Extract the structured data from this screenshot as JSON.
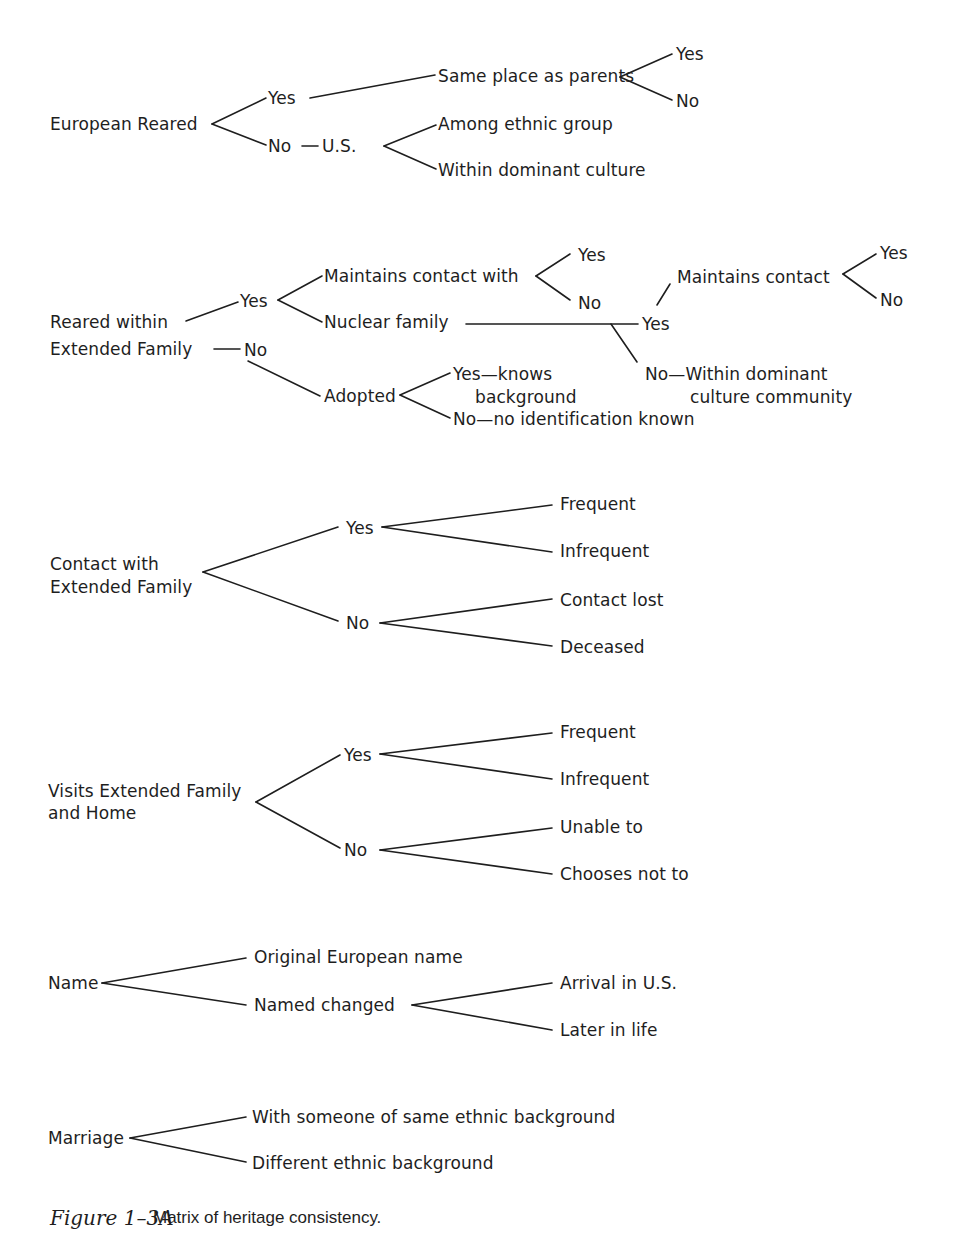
{
  "diagram": {
    "title": "Matrix of heritage consistency",
    "sections": [
      {
        "root": "European Reared",
        "nodes": {
          "yes": "Yes",
          "same_place": "Same place as parents",
          "same_place_yes": "Yes",
          "same_place_no": "No",
          "no": "No",
          "us": "U.S.",
          "among": "Among ethnic group",
          "within": "Within dominant culture"
        }
      },
      {
        "root_line1": "Reared within",
        "root_line2": "Extended Family",
        "nodes": {
          "yes": "Yes",
          "maintains_with": "Maintains contact with",
          "maintains_with_yes": "Yes",
          "maintains_with_no": "No",
          "nuclear": "Nuclear family",
          "nuclear_yes": "Yes",
          "maintains": "Maintains contact",
          "maintains_yes": "Yes",
          "maintains_no": "No",
          "nuclear_no_line1": "No—Within dominant",
          "nuclear_no_line2": "culture community",
          "no": "No",
          "adopted": "Adopted",
          "adopted_yes_line1": "Yes—knows",
          "adopted_yes_line2": "background",
          "adopted_no": "No—no identification known"
        }
      },
      {
        "root_line1": "Contact with",
        "root_line2": "Extended Family",
        "nodes": {
          "yes": "Yes",
          "frequent": "Frequent",
          "infrequent": "Infrequent",
          "no": "No",
          "lost": "Contact lost",
          "deceased": "Deceased"
        }
      },
      {
        "root_line1": "Visits Extended Family",
        "root_line2": "and Home",
        "nodes": {
          "yes": "Yes",
          "frequent": "Frequent",
          "infrequent": "Infrequent",
          "no": "No",
          "unable": "Unable to",
          "chooses": "Chooses not to"
        }
      },
      {
        "root": "Name",
        "nodes": {
          "original": "Original European name",
          "changed": "Named changed",
          "arrival": "Arrival in U.S.",
          "later": "Later in life"
        }
      },
      {
        "root": "Marriage",
        "nodes": {
          "same": "With someone of same ethnic background",
          "different": "Different ethnic background"
        }
      }
    ]
  },
  "caption": {
    "label": "Figure 1–3A",
    "text": "Matrix of heritage consistency."
  }
}
